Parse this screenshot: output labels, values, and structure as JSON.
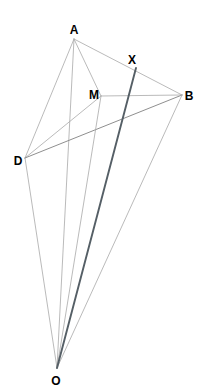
{
  "figure": {
    "type": "geometry-diagram",
    "title": "",
    "width": 206,
    "height": 391,
    "background_color": "#ffffff",
    "line_color_light": "#a8a8a8",
    "line_color_mid": "#8f8f8f",
    "line_color_dark": "#555f66",
    "label_color": "#000000"
  },
  "points": {
    "A": {
      "label": "A",
      "x": 74,
      "y": 39,
      "label_x": 74,
      "label_y": 30
    },
    "B": {
      "label": "B",
      "x": 182,
      "y": 95,
      "label_x": 189,
      "label_y": 96
    },
    "D": {
      "label": "D",
      "x": 25,
      "y": 158,
      "label_x": 18,
      "label_y": 161
    },
    "M": {
      "label": "M",
      "x": 101,
      "y": 96,
      "label_x": 94,
      "label_y": 95
    },
    "X": {
      "label": "X",
      "x": 136,
      "y": 68,
      "label_x": 132,
      "label_y": 60
    },
    "O": {
      "label": "O",
      "x": 57,
      "y": 368,
      "label_x": 56,
      "label_y": 381
    }
  },
  "segments": [
    {
      "name": "A-B",
      "from": "A",
      "to": "B",
      "weight": "light"
    },
    {
      "name": "A-D",
      "from": "A",
      "to": "D",
      "weight": "light"
    },
    {
      "name": "A-M",
      "from": "A",
      "to": "M",
      "weight": "light"
    },
    {
      "name": "A-O",
      "from": "A",
      "to": "O",
      "weight": "light"
    },
    {
      "name": "D-M",
      "from": "D",
      "to": "M",
      "weight": "light"
    },
    {
      "name": "D-B",
      "from": "D",
      "to": "B",
      "weight": "mid"
    },
    {
      "name": "D-O",
      "from": "D",
      "to": "O",
      "weight": "light"
    },
    {
      "name": "M-B",
      "from": "M",
      "to": "B",
      "weight": "light"
    },
    {
      "name": "M-O",
      "from": "M",
      "to": "O",
      "weight": "light"
    },
    {
      "name": "B-O",
      "from": "B",
      "to": "O",
      "weight": "light"
    },
    {
      "name": "X-O",
      "from": "X",
      "to": "O",
      "weight": "dark"
    }
  ]
}
